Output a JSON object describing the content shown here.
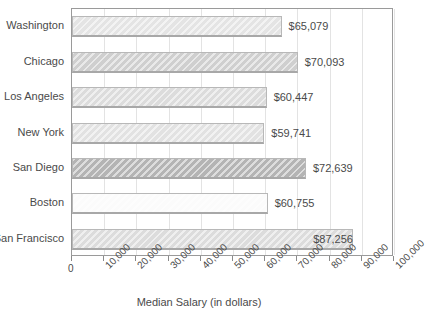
{
  "chart_data": {
    "type": "bar",
    "orientation": "horizontal",
    "title": "",
    "xlabel": "Median Salary (in dollars)",
    "ylabel": "",
    "categories": [
      "Washington",
      "Chicago",
      "Los Angeles",
      "New York",
      "San Diego",
      "Boston",
      "San Francisco"
    ],
    "values": [
      65079,
      70093,
      60447,
      59741,
      72639,
      60755,
      87256
    ],
    "value_labels": [
      "$65,079",
      "$70,093",
      "$60,447",
      "$59,741",
      "$72,639",
      "$60,755",
      "$87,256"
    ],
    "bar_colors": [
      "#e4e4e4",
      "#cfcfcf",
      "#dcdcdc",
      "#e2e2e2",
      "#b4b4b4",
      "#fbfbfb",
      "#dcdcdc"
    ],
    "label_position": [
      "outside",
      "outside",
      "outside",
      "outside",
      "outside",
      "outside",
      "inside"
    ],
    "xlim": [
      0,
      100000
    ],
    "xticks": [
      0,
      10000,
      20000,
      30000,
      40000,
      50000,
      60000,
      70000,
      80000,
      90000,
      100000
    ],
    "xtick_labels": [
      "0",
      "10,000",
      "20,000",
      "30,000",
      "40,000",
      "50,000",
      "60,000",
      "70,000",
      "80,000",
      "90,000",
      "100,000"
    ],
    "grid": true,
    "grid_axis": "x",
    "legend": null
  },
  "axis": {
    "x_title": "Median Salary (in dollars)"
  }
}
